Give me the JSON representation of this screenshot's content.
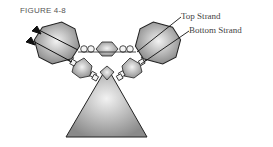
{
  "figure": {
    "label": "FIGURE 4-8",
    "callouts": {
      "top_strand": "Top Strand",
      "bottom_strand": "Bottom Strand"
    },
    "colors": {
      "bead_fill_light": "#e6e6e6",
      "bead_fill_dark": "#8c8c8c",
      "outline": "#222222",
      "text": "#444444"
    }
  }
}
